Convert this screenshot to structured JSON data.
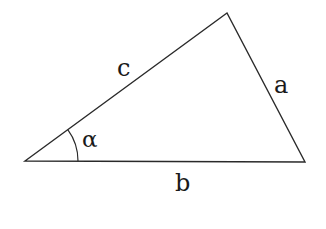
{
  "diagram": {
    "type": "triangle",
    "vertices": {
      "left": [
        25,
        161
      ],
      "top": [
        227,
        13
      ],
      "right": [
        305,
        162
      ]
    },
    "sides": {
      "a": "a",
      "b": "b",
      "c": "c"
    },
    "angle": {
      "label": "α",
      "vertex": "left"
    },
    "colors": {
      "stroke": "#2a2a2a",
      "text": "#1a1a1a",
      "background": "#ffffff"
    }
  }
}
